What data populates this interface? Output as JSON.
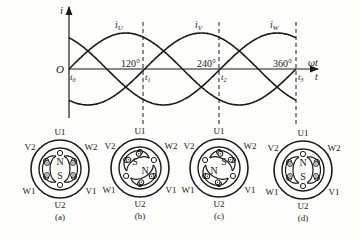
{
  "waveform": {
    "y_axis_label": "i",
    "origin_label": "O",
    "x_axis_label_top": "ωt",
    "x_axis_label_bottom": "t",
    "curves": [
      {
        "name": "i",
        "sub": "U",
        "phase_deg": 0
      },
      {
        "name": "i",
        "sub": "V",
        "phase_deg": -120
      },
      {
        "name": "i",
        "sub": "W",
        "phase_deg": -240
      }
    ],
    "angle_ticks": [
      "120°",
      "240°",
      "360°"
    ],
    "time_marks": [
      {
        "name": "t",
        "sub": "0"
      },
      {
        "name": "t",
        "sub": "1"
      },
      {
        "name": "t",
        "sub": "2"
      },
      {
        "name": "t",
        "sub": "3"
      }
    ]
  },
  "motors": [
    {
      "caption": "(a)",
      "field_angle_deg": 0,
      "top_pole": "N",
      "bottom_pole": "S"
    },
    {
      "caption": "(b)",
      "field_angle_deg": 120
    },
    {
      "caption": "(c)",
      "field_angle_deg": 240
    },
    {
      "caption": "(d)",
      "field_angle_deg": 360,
      "top_pole": "N",
      "bottom_pole": "S"
    }
  ],
  "terminal_labels": {
    "top": "U1",
    "bottom": "U2",
    "upper_left": "V2",
    "upper_right": "W2",
    "lower_left": "W1",
    "lower_right": "V1"
  },
  "pole_labels": {
    "n": "N",
    "s": "S"
  }
}
